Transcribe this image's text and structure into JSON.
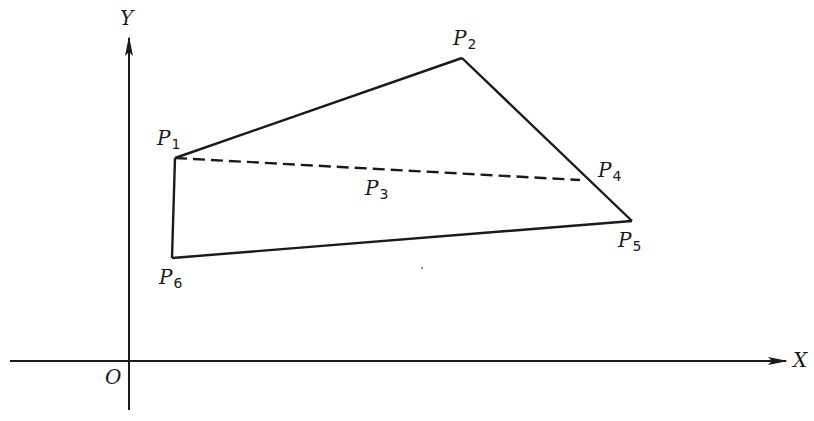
{
  "diagram": {
    "colors": {
      "stroke": "#1a1a1a",
      "background": "#ffffff"
    },
    "axes": {
      "x_label": "X",
      "y_label": "Y",
      "origin_label": "O"
    },
    "points": [
      {
        "id": "P1",
        "letter": "P",
        "sub": "1",
        "x": 175,
        "y": 158
      },
      {
        "id": "P2",
        "letter": "P",
        "sub": "2",
        "x": 462,
        "y": 58
      },
      {
        "id": "P3",
        "letter": "P",
        "sub": "3"
      },
      {
        "id": "P4",
        "letter": "P",
        "sub": "4",
        "x": 580,
        "y": 180
      },
      {
        "id": "P5",
        "letter": "P",
        "sub": "5",
        "x": 632,
        "y": 221
      },
      {
        "id": "P6",
        "letter": "P",
        "sub": "6",
        "x": 172,
        "y": 258
      }
    ],
    "solid_edges": [
      [
        "P1",
        "P2"
      ],
      [
        "P2",
        "P5"
      ],
      [
        "P5",
        "P6"
      ],
      [
        "P6",
        "P1"
      ]
    ],
    "dashed_edges": [
      [
        "P1",
        "P4"
      ]
    ]
  }
}
